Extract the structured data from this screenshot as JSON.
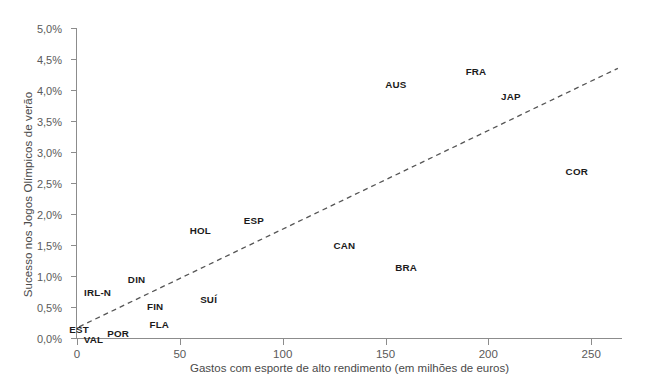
{
  "chart_data": {
    "type": "scatter",
    "title": "",
    "xlabel": "Gastos com esporte de alto rendimento (em milhões de euros)",
    "ylabel": "Sucesso nos Jogos Olímpicos de verão",
    "xlim": [
      0,
      265
    ],
    "ylim": [
      0,
      5
    ],
    "grid": false,
    "legend": null,
    "x_ticks": [
      "0",
      "50",
      "100",
      "150",
      "200",
      "250"
    ],
    "x_tick_values": [
      0,
      50,
      100,
      150,
      200,
      250
    ],
    "y_ticks": [
      "0,0%",
      "0,5%",
      "1,0%",
      "1,5%",
      "2,0%",
      "2,5%",
      "3,0%",
      "3,5%",
      "4,0%",
      "4,5%",
      "5,0%"
    ],
    "y_tick_values": [
      0,
      0.5,
      1.0,
      1.5,
      2.0,
      2.5,
      3.0,
      3.5,
      4.0,
      4.5,
      5.0
    ],
    "point_label_style": "text-only (country codes mark the data positions)",
    "points": [
      {
        "label": "EST",
        "x": 1,
        "y": 0.15
      },
      {
        "label": "VAL",
        "x": 8,
        "y": -0.02
      },
      {
        "label": "POR",
        "x": 20,
        "y": 0.08
      },
      {
        "label": "IRL-N",
        "x": 10,
        "y": 0.75
      },
      {
        "label": "DIN",
        "x": 29,
        "y": 0.95
      },
      {
        "label": "FIN",
        "x": 38,
        "y": 0.52
      },
      {
        "label": "FLA",
        "x": 40,
        "y": 0.22
      },
      {
        "label": "SUÍ",
        "x": 64,
        "y": 0.63
      },
      {
        "label": "HOL",
        "x": 60,
        "y": 1.75
      },
      {
        "label": "ESP",
        "x": 86,
        "y": 1.9
      },
      {
        "label": "CAN",
        "x": 130,
        "y": 1.5
      },
      {
        "label": "BRA",
        "x": 160,
        "y": 1.15
      },
      {
        "label": "AUS",
        "x": 155,
        "y": 4.1
      },
      {
        "label": "FRA",
        "x": 194,
        "y": 4.3
      },
      {
        "label": "JAP",
        "x": 211,
        "y": 3.9
      },
      {
        "label": "COR",
        "x": 243,
        "y": 2.7
      }
    ],
    "trend_line": {
      "style": "dashed",
      "color": "#555555",
      "x_start": 1,
      "y_start": 0.18,
      "x_end": 263,
      "y_end": 4.35
    },
    "colors": {
      "axis": "#8c8c8c",
      "tick_label": "#5a5a5a",
      "axis_title": "#4a4a4a",
      "point_label": "#1b1b1b",
      "trend_line": "#555555",
      "background": "#ffffff"
    }
  }
}
